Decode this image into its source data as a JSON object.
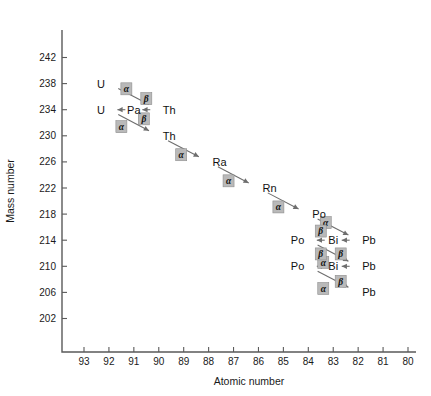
{
  "chart_data": {
    "type": "scatter",
    "title": "",
    "xlabel": "Atomic number",
    "ylabel": "Mass number",
    "xlim": [
      93.5,
      80
    ],
    "ylim": [
      200,
      244
    ],
    "x_ticks": [
      93,
      92,
      91,
      90,
      89,
      88,
      87,
      86,
      85,
      84,
      83,
      82,
      81,
      80
    ],
    "y_ticks": [
      242,
      238,
      234,
      230,
      226,
      222,
      218,
      214,
      210,
      206,
      202
    ],
    "x_axis_reversed": true,
    "grid": false,
    "legend": "none",
    "nuclides": [
      {
        "label": "U",
        "z": 92,
        "a": 238,
        "anchor": "end"
      },
      {
        "label": "Th",
        "z": 90,
        "a": 234,
        "anchor": "start"
      },
      {
        "label": "Pa",
        "z": 91,
        "a": 234,
        "anchor": "middle"
      },
      {
        "label": "U",
        "z": 92,
        "a": 234,
        "anchor": "end"
      },
      {
        "label": "Th",
        "z": 90,
        "a": 230,
        "anchor": "start"
      },
      {
        "label": "Ra",
        "z": 88,
        "a": 226,
        "anchor": "start"
      },
      {
        "label": "Rn",
        "z": 86,
        "a": 222,
        "anchor": "start"
      },
      {
        "label": "Po",
        "z": 84,
        "a": 218,
        "anchor": "start"
      },
      {
        "label": "Pb",
        "z": 82,
        "a": 214,
        "anchor": "start"
      },
      {
        "label": "Bi",
        "z": 83,
        "a": 214,
        "anchor": "middle"
      },
      {
        "label": "Po",
        "z": 84,
        "a": 214,
        "anchor": "end"
      },
      {
        "label": "Pb",
        "z": 82,
        "a": 210,
        "anchor": "start"
      },
      {
        "label": "Bi",
        "z": 83,
        "a": 210,
        "anchor": "middle"
      },
      {
        "label": "Po",
        "z": 84,
        "a": 210,
        "anchor": "end"
      },
      {
        "label": "Pb",
        "z": 82,
        "a": 206,
        "anchor": "start"
      }
    ],
    "decays": [
      {
        "type": "alpha",
        "symbol": "α",
        "from_z": 92,
        "from_a": 238,
        "to_z": 90,
        "to_a": 234
      },
      {
        "type": "beta",
        "symbol": "β",
        "from_z": 90,
        "from_a": 234,
        "to_z": 91,
        "to_a": 234
      },
      {
        "type": "beta",
        "symbol": "β",
        "from_z": 91,
        "from_a": 234,
        "to_z": 92,
        "to_a": 234
      },
      {
        "type": "alpha",
        "symbol": "α",
        "from_z": 92,
        "from_a": 234,
        "to_z": 90,
        "to_a": 230
      },
      {
        "type": "alpha",
        "symbol": "α",
        "from_z": 90,
        "from_a": 230,
        "to_z": 88,
        "to_a": 226
      },
      {
        "type": "alpha",
        "symbol": "α",
        "from_z": 88,
        "from_a": 226,
        "to_z": 86,
        "to_a": 222
      },
      {
        "type": "alpha",
        "symbol": "α",
        "from_z": 86,
        "from_a": 222,
        "to_z": 84,
        "to_a": 218
      },
      {
        "type": "alpha",
        "symbol": "α",
        "from_z": 84,
        "from_a": 218,
        "to_z": 82,
        "to_a": 214
      },
      {
        "type": "beta",
        "symbol": "β",
        "from_z": 82,
        "from_a": 214,
        "to_z": 83,
        "to_a": 214
      },
      {
        "type": "beta",
        "symbol": "β",
        "from_z": 83,
        "from_a": 214,
        "to_z": 84,
        "to_a": 214
      },
      {
        "type": "alpha",
        "symbol": "α",
        "from_z": 84,
        "from_a": 214,
        "to_z": 82,
        "to_a": 210
      },
      {
        "type": "beta",
        "symbol": "β",
        "from_z": 82,
        "from_a": 210,
        "to_z": 83,
        "to_a": 210
      },
      {
        "type": "beta",
        "symbol": "β",
        "from_z": 83,
        "from_a": 210,
        "to_z": 84,
        "to_a": 210
      },
      {
        "type": "alpha",
        "symbol": "α",
        "from_z": 84,
        "from_a": 210,
        "to_z": 82,
        "to_a": 206
      }
    ],
    "decay_label_positions": [
      {
        "idx": 0,
        "z": 91.3,
        "a": 237.2
      },
      {
        "idx": 1,
        "z": 90.5,
        "a": 235.7
      },
      {
        "idx": 2,
        "z": 90.6,
        "a": 232.6
      },
      {
        "idx": 3,
        "z": 91.5,
        "a": 231.4
      },
      {
        "idx": 4,
        "z": 89.1,
        "a": 227.1
      },
      {
        "idx": 5,
        "z": 87.2,
        "a": 223.1
      },
      {
        "idx": 6,
        "z": 85.2,
        "a": 219.1
      },
      {
        "idx": 7,
        "z": 83.3,
        "a": 216.7
      },
      {
        "idx": 8,
        "z": 83.5,
        "a": 215.4
      },
      {
        "idx": 9,
        "z": 82.7,
        "a": 211.9
      },
      {
        "idx": 10,
        "z": 83.4,
        "a": 210.6
      },
      {
        "idx": 11,
        "z": 83.5,
        "a": 211.9
      },
      {
        "idx": 12,
        "z": 82.7,
        "a": 207.7
      },
      {
        "idx": 13,
        "z": 83.4,
        "a": 206.6
      }
    ]
  }
}
